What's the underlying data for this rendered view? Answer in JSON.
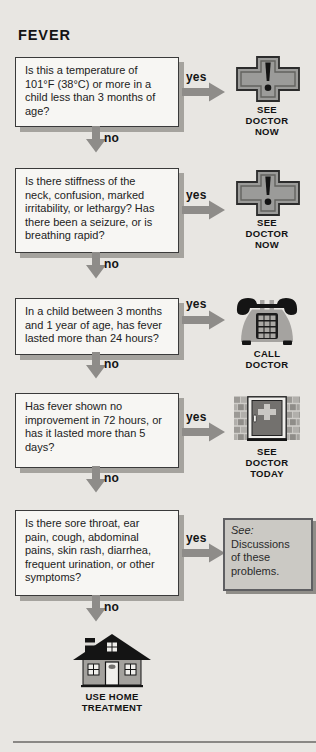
{
  "page": {
    "title": "FEVER",
    "yes_label": "yes",
    "no_label": "no"
  },
  "steps": [
    {
      "question": "Is this a temperature of\n101°F (38°C) or more in a\nchild less than 3 months of\nage?",
      "action": "SEE\nDOCTOR\nNOW",
      "icon": "medical-cross-exclamation"
    },
    {
      "question": "Is there stiffness of the\nneck, confusion, marked\nirritability, or lethargy? Has\nthere been a seizure, or is\nbreathing rapid?",
      "action": "SEE\nDOCTOR\nNOW",
      "icon": "medical-cross-exclamation"
    },
    {
      "question": "In a child between 3 months\nand 1 year of age, has fever\nlasted more than 24 hours?",
      "action": "CALL\nDOCTOR",
      "icon": "telephone"
    },
    {
      "question": "Has fever shown no\nimprovement in 72 hours, or\nhas it lasted more than 5\ndays?",
      "action": "SEE\nDOCTOR\nTODAY",
      "icon": "clinic-door"
    },
    {
      "question": "Is there sore throat, ear\npain, cough, abdominal\npains, skin rash, diarrhea,\nfrequent urination, or other\nsymptoms?",
      "see_note": {
        "lead": "See:",
        "body": "Discussions\nof these\nproblems."
      }
    }
  ],
  "final": {
    "action": "USE HOME\nTREATMENT",
    "icon": "house"
  },
  "colors": {
    "background": "#e8e6e2",
    "box_fill": "#f7f6f3",
    "box_border": "#3a3a3a",
    "box_shadow": "#a5a39e",
    "arrow_gray": "#8e8c89",
    "see_box_fill": "#cbc9c4",
    "icon_gray": "#9b9b99",
    "icon_black": "#141414"
  }
}
